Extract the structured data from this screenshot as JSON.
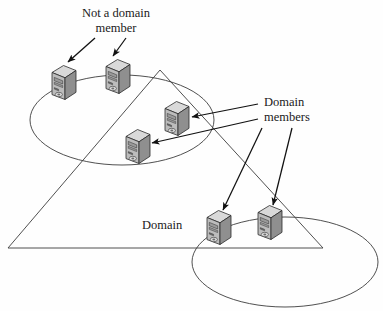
{
  "figure": {
    "background_color": "#fefefe",
    "stroke_color": "#3c3c3c",
    "arrow_color": "#111111"
  },
  "labels": {
    "not_a_domain_member": "Not a domain\nmember",
    "domain_members": "Domain\nmembers",
    "domain": "Domain"
  },
  "shapes": {
    "triangle": {
      "name": "domain-triangle",
      "points": "160,70 8,248 323,248"
    },
    "ellipse_top_left": {
      "name": "workgroup-ellipse-top-left",
      "cx": 122,
      "cy": 120,
      "rx": 92,
      "ry": 45
    },
    "ellipse_bottom_right": {
      "name": "workgroup-ellipse-bottom-right",
      "cx": 285,
      "cy": 262,
      "rx": 93,
      "ry": 45
    }
  },
  "servers": [
    {
      "id": "server-1",
      "name": "server-icon-top-left-outside",
      "x": 50,
      "y": 64,
      "scale": 1.0
    },
    {
      "id": "server-2",
      "name": "server-icon-top-middle-outside",
      "x": 104,
      "y": 58,
      "scale": 1.0
    },
    {
      "id": "server-3",
      "name": "server-icon-domain-upper",
      "x": 163,
      "y": 100,
      "scale": 1.0
    },
    {
      "id": "server-4",
      "name": "server-icon-domain-lower",
      "x": 124,
      "y": 128,
      "scale": 1.0
    },
    {
      "id": "server-5",
      "name": "server-icon-domain-bottom-left",
      "x": 205,
      "y": 209,
      "scale": 1.0
    },
    {
      "id": "server-6",
      "name": "server-icon-domain-bottom-right",
      "x": 256,
      "y": 204,
      "scale": 1.0
    }
  ],
  "arrows": [
    {
      "name": "arrow-not-member-to-server-1",
      "x1": 95,
      "y1": 38,
      "x2": 68,
      "y2": 62
    },
    {
      "name": "arrow-not-member-to-server-2",
      "x1": 126,
      "y1": 38,
      "x2": 112,
      "y2": 56
    },
    {
      "name": "arrow-members-to-server-3",
      "x1": 258,
      "y1": 104,
      "x2": 192,
      "y2": 117
    },
    {
      "name": "arrow-members-to-server-4",
      "x1": 258,
      "y1": 118,
      "x2": 152,
      "y2": 143
    },
    {
      "name": "arrow-members-to-server-5",
      "x1": 262,
      "y1": 128,
      "x2": 222,
      "y2": 210
    },
    {
      "name": "arrow-members-to-server-6",
      "x1": 290,
      "y1": 128,
      "x2": 272,
      "y2": 205
    }
  ],
  "colors": {
    "server_top_face": "#d9d9d9",
    "server_front_face": "#b4b4b4",
    "server_side_face": "#8f8f8f",
    "server_outline": "#2b2b2b",
    "line": "#3c3c3c",
    "text": "#1a1a1a"
  }
}
